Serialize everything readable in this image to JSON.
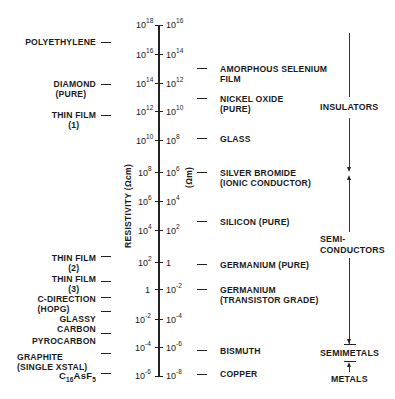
{
  "diagram": {
    "axis": {
      "title_left": "RESISTIVITY (Ωcm)",
      "title_right": "(Ωm)",
      "ticks": [
        {
          "cm_base": "10",
          "cm_exp": "18",
          "m_base": "10",
          "m_exp": "16"
        },
        {
          "cm_base": "10",
          "cm_exp": "16",
          "m_base": "10",
          "m_exp": "14"
        },
        {
          "cm_base": "10",
          "cm_exp": "14",
          "m_base": "10",
          "m_exp": "12"
        },
        {
          "cm_base": "10",
          "cm_exp": "12",
          "m_base": "10",
          "m_exp": "10"
        },
        {
          "cm_base": "10",
          "cm_exp": "10",
          "m_base": "10",
          "m_exp": "8"
        },
        {
          "cm_base": "10",
          "cm_exp": "8",
          "m_base": "10",
          "m_exp": "6"
        },
        {
          "cm_base": "10",
          "cm_exp": "6",
          "m_base": "10",
          "m_exp": "4"
        },
        {
          "cm_base": "10",
          "cm_exp": "4",
          "m_base": "10",
          "m_exp": "2"
        },
        {
          "cm_base": "10",
          "cm_exp": "2",
          "m_base": "1",
          "m_exp": ""
        },
        {
          "cm_base": "1",
          "cm_exp": "",
          "m_base": "10",
          "m_exp": "-2"
        },
        {
          "cm_base": "10",
          "cm_exp": "-2",
          "m_base": "10",
          "m_exp": "-4"
        },
        {
          "cm_base": "10",
          "cm_exp": "-4",
          "m_base": "10",
          "m_exp": "-6"
        },
        {
          "cm_base": "10",
          "cm_exp": "-6",
          "m_base": "10",
          "m_exp": "-8"
        }
      ]
    },
    "left_materials": [
      {
        "line1": "POLYETHYLENE",
        "line2": ""
      },
      {
        "line1": "DIAMOND",
        "line2": "(PURE)"
      },
      {
        "line1": "THIN FILM",
        "line2": "(1)"
      },
      {
        "line1": "THIN FILM",
        "line2": "(2)"
      },
      {
        "line1": "THIN FILM",
        "line2": "(3)"
      },
      {
        "line1": "C-DIRECTION",
        "line2": "(HOPG)"
      },
      {
        "line1": "GLASSY",
        "line2": "CARBON"
      },
      {
        "line1": "PYROCARBON",
        "line2": ""
      },
      {
        "line1": "GRAPHITE",
        "line2": "(SINGLE XSTAL)"
      },
      {
        "formula_c": "C",
        "formula_c_sub": "16",
        "formula_mid": "AsF",
        "formula_f_sub": "5"
      }
    ],
    "right_materials": [
      {
        "line1": "AMORPHOUS SELENIUM",
        "line2": "FILM"
      },
      {
        "line1": "NICKEL OXIDE",
        "line2": "(PURE)"
      },
      {
        "line1": "GLASS",
        "line2": ""
      },
      {
        "line1": "SILVER BROMIDE",
        "line2": "(IONIC CONDUCTOR)"
      },
      {
        "line1": "SILICON (PURE)",
        "line2": ""
      },
      {
        "line1": "GERMANIUM (PURE)",
        "line2": ""
      },
      {
        "line1": "GERMANIUM",
        "line2": "(TRANSISTOR GRADE)"
      },
      {
        "line1": "BISMUTH",
        "line2": ""
      },
      {
        "line1": "COPPER",
        "line2": ""
      }
    ],
    "classes": {
      "insulators": "INSULATORS",
      "semiconductors_1": "SEMI-",
      "semiconductors_2": "CONDUCTORS",
      "semimetals": "SEMIMETALS",
      "metals": "METALS"
    }
  }
}
